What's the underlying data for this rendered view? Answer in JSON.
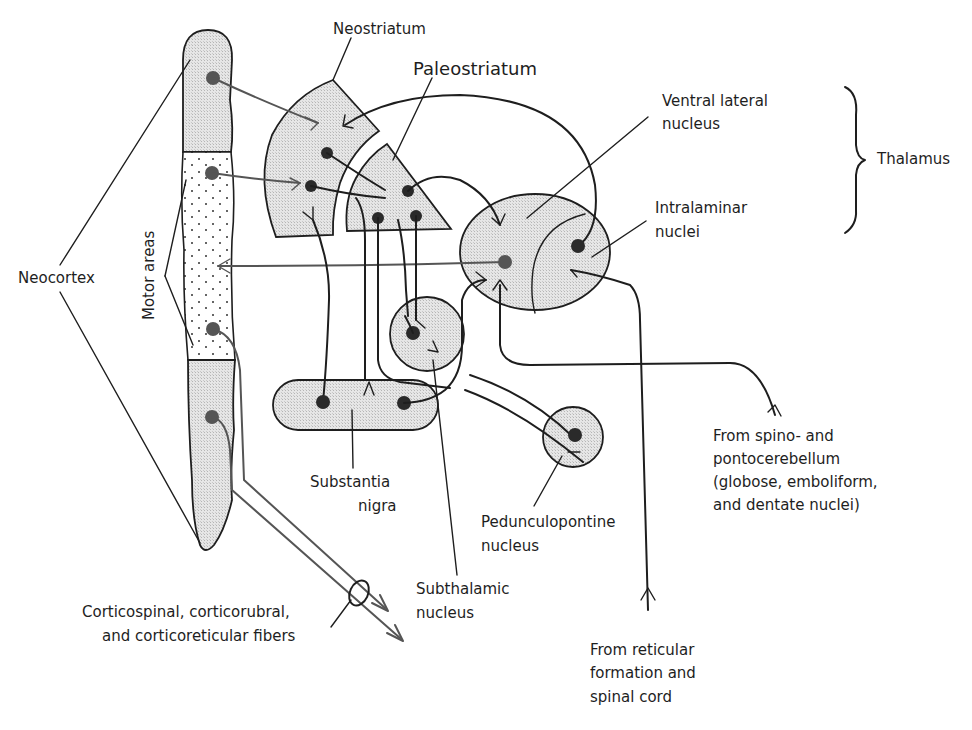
{
  "diagram": {
    "labels": {
      "neostriatum": "Neostriatum",
      "paleostriatum": "Paleostriatum",
      "ventral_lateral_line1": "Ventral lateral",
      "ventral_lateral_line2": "nucleus",
      "thalamus": "Thalamus",
      "intralaminar_line1": "Intralaminar",
      "intralaminar_line2": "nuclei",
      "neocortex": "Neocortex",
      "motor_areas": "Motor areas",
      "substantia_line1": "Substantia",
      "substantia_line2": "nigra",
      "pedunculopontine_line1": "Pedunculopontine",
      "pedunculopontine_line2": "nucleus",
      "subthalamic_line1": "Subthalamic",
      "subthalamic_line2": "nucleus",
      "cerebellum_line1": "From spino- and",
      "cerebellum_line2": "pontocerebellum",
      "cerebellum_line3": "(globose, emboliform,",
      "cerebellum_line4": "and dentate nuclei)",
      "reticular_line1": "From reticular",
      "reticular_line2": "formation and",
      "reticular_line3": "spinal cord",
      "fibers_line1": "Corticospinal, corticorubral,",
      "fibers_line2": "and corticoreticular fibers"
    },
    "structures": [
      "Neocortex",
      "Motor areas",
      "Neostriatum",
      "Paleostriatum",
      "Ventral lateral nucleus",
      "Intralaminar nuclei",
      "Thalamus",
      "Substantia nigra",
      "Subthalamic nucleus",
      "Pedunculopontine nucleus"
    ],
    "colors": {
      "ink": "#1e1e1e",
      "cortical_projection": "#555555",
      "shading": "#d9d9d9"
    }
  }
}
